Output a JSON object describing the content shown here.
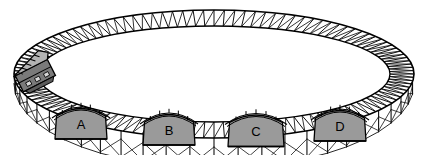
{
  "figure": {
    "name": "elevated-oval-track-diagram",
    "background_color": "#ffffff",
    "line_color": "#000000",
    "fill_gray": "#9a9a9a",
    "fill_gray_dark": "#7a7a7a",
    "fill_gray_light": "#b4b4b4",
    "width": 429,
    "height": 155
  },
  "track": {
    "name": "oval-track-loop",
    "shape": "ellipse-perspective",
    "center_x": 214,
    "center_y": 74,
    "outer_rx": 200,
    "outer_ry": 64,
    "inner_rx": 176,
    "inner_ry": 48,
    "tie_count": 120,
    "description": "Closed elliptical elevated railway viewed in perspective with cross-hatched ties"
  },
  "trestle": {
    "name": "front-trestle-supports",
    "leg_count": 26,
    "brace_style": "x-cross",
    "description": "Vertical support legs with X bracing beneath the front run of track"
  },
  "vehicle": {
    "name": "tram-car",
    "label": "",
    "position_x": 34,
    "position_y": 73,
    "body_color": "#7a7a7a",
    "roof_color": "#b4b4b4",
    "description": "Single tram / locomotive car riding on the left side of the loop"
  },
  "stations": [
    {
      "id": "station-a",
      "label": "A",
      "cx": 81,
      "cy": 123,
      "half_width": 26,
      "height": 32
    },
    {
      "id": "station-b",
      "label": "B",
      "cx": 169,
      "cy": 129,
      "half_width": 26,
      "height": 32
    },
    {
      "id": "station-c",
      "label": "C",
      "cx": 256,
      "cy": 130,
      "half_width": 28,
      "height": 33
    },
    {
      "id": "station-d",
      "label": "D",
      "cx": 340,
      "cy": 125,
      "half_width": 26,
      "height": 32
    }
  ]
}
